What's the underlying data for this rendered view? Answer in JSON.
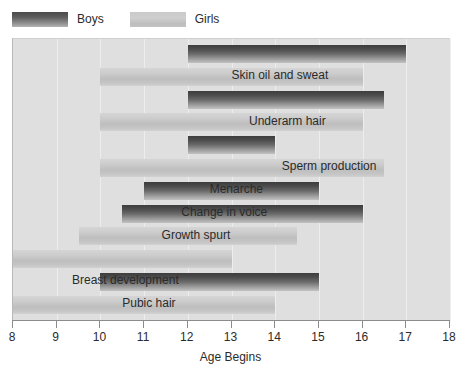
{
  "legend": {
    "entries": [
      {
        "key": "boys",
        "label": "Boys",
        "color": "#4a4a4a"
      },
      {
        "key": "girls",
        "label": "Girls",
        "color": "#c9c9c9"
      }
    ]
  },
  "axis": {
    "title": "Age Begins",
    "ticks": [
      8,
      9,
      10,
      11,
      12,
      13,
      14,
      15,
      16,
      17,
      18
    ]
  },
  "colors": {
    "plot_background": "#dfdfdf",
    "page_background": "#ffffff",
    "boys_bar": "#4a4a4a",
    "girls_bar": "#c9c9c9",
    "gridline": "#ededed",
    "axis_line": "#8c8c8c",
    "text": "#2b2b2b"
  },
  "chart_data": {
    "type": "bar",
    "orientation": "horizontal",
    "subtype": "range-bar",
    "title": "",
    "xlabel": "Age Begins",
    "ylabel": "",
    "xlim": [
      8,
      18
    ],
    "xticks": [
      8,
      9,
      10,
      11,
      12,
      13,
      14,
      15,
      16,
      17,
      18
    ],
    "grid": true,
    "legend": [
      "Boys",
      "Girls"
    ],
    "legend_position": "top-left",
    "categories": [
      "Skin oil and sweat",
      "Underarm hair",
      "Sperm production",
      "Menarche",
      "Change in voice",
      "Growth spurt",
      "Breast development",
      "Pubic hair"
    ],
    "bars": [
      {
        "label": "Skin oil and sweat",
        "series": "Boys",
        "start": 12,
        "end": 17,
        "row": 0
      },
      {
        "label": "Skin oil and sweat",
        "series": "Girls",
        "start": 10,
        "end": 16,
        "row": 1
      },
      {
        "label": "Underarm hair",
        "series": "Boys",
        "start": 12,
        "end": 16.5,
        "row": 2
      },
      {
        "label": "Underarm hair",
        "series": "Girls",
        "start": 10,
        "end": 16,
        "row": 3
      },
      {
        "label": "Sperm production",
        "series": "Boys",
        "start": 12,
        "end": 14,
        "row": 4
      },
      {
        "label": "Menarche",
        "series": "Girls",
        "start": 10,
        "end": 16.5,
        "row": 5
      },
      {
        "label": "Change in voice",
        "series": "Boys",
        "start": 11,
        "end": 15,
        "row": 6
      },
      {
        "label": "Growth spurt",
        "series": "Boys",
        "start": 10.5,
        "end": 16,
        "row": 7
      },
      {
        "label": "Growth spurt",
        "series": "Girls",
        "start": 9.5,
        "end": 14.5,
        "row": 8
      },
      {
        "label": "Breast development",
        "series": "Girls",
        "start": 8,
        "end": 13,
        "row": 9
      },
      {
        "label": "Pubic hair",
        "series": "Boys",
        "start": 10,
        "end": 15,
        "row": 10
      },
      {
        "label": "Pubic hair",
        "series": "Girls",
        "start": 8,
        "end": 14,
        "row": 11
      }
    ],
    "labels": [
      {
        "text": "Skin oil and sweat",
        "x": 13.0,
        "row": 0
      },
      {
        "text": "Underarm hair",
        "x": 13.4,
        "row": 2
      },
      {
        "text": "Sperm production",
        "x": 14.15,
        "row": 4
      },
      {
        "text": "Menarche",
        "x": 12.5,
        "row": 5
      },
      {
        "text": "Change in voice",
        "x": 11.85,
        "row": 6
      },
      {
        "text": "Growth spurt",
        "x": 11.4,
        "row": 7
      },
      {
        "text": "Breast development",
        "x": 9.35,
        "row": 9
      },
      {
        "text": "Pubic hair",
        "x": 10.5,
        "row": 10
      }
    ]
  }
}
